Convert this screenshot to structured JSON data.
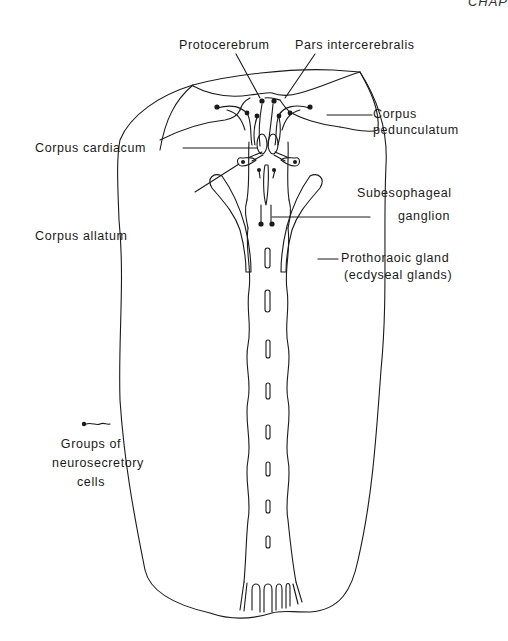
{
  "page": {
    "header_fragment": "CHAP"
  },
  "diagram": {
    "labels": {
      "protocerebrum": "Protocerebrum",
      "pars_intercerebralis": "Pars intercerebralis",
      "corpus_pedunculatum_1": "Corpus",
      "corpus_pedunculatum_2": "pedunculatum",
      "corpus_cardiacum": "Corpus cardiacum",
      "corpus_allatum": "Corpus allatum",
      "subesophageal_1": "Subesophageal",
      "subesophageal_2": "ganglion",
      "prothoracic_1": "Prothoraoic gland",
      "prothoracic_2": "(ecdyseal glands)"
    },
    "legend": {
      "symbol": "neurosecretory-cell-symbol",
      "line1": "Groups of",
      "line2": "neurosecretory",
      "line3": "cells"
    },
    "colors": {
      "line": "#1a1a1a",
      "background": "#ffffff"
    }
  }
}
